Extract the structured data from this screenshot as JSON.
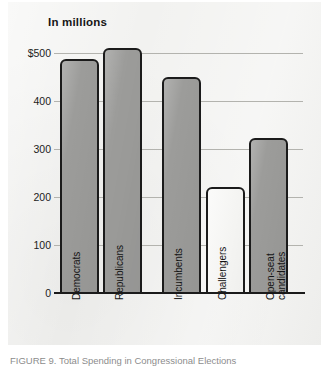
{
  "figure": {
    "caption": "FIGURE 9. Total Spending in Congressional Elections"
  },
  "chart_data": {
    "type": "bar",
    "title": "In millions",
    "xlabel": "",
    "ylabel": "",
    "categories": [
      "Democrats",
      "Republicans",
      "Incumbents",
      "Challengers",
      "Open-seat candidates"
    ],
    "values": [
      487,
      511,
      450,
      220,
      322
    ],
    "ylim": [
      0,
      500
    ],
    "yticks": [
      0,
      100,
      200,
      300,
      400,
      500
    ],
    "ytick_labels": [
      "0",
      "100",
      "200",
      "300",
      "400",
      "$500"
    ],
    "grid": true,
    "legend": "none",
    "colors": {
      "bar_fill": "#9c9c9a",
      "bar_fill_light": "#f7f7f5",
      "bar_outline": "#1b1b1b",
      "gridline": "#b3b3ae",
      "axis": "#1a1a1a",
      "panel_background": "#f2f2f0",
      "text": "#141414"
    }
  }
}
